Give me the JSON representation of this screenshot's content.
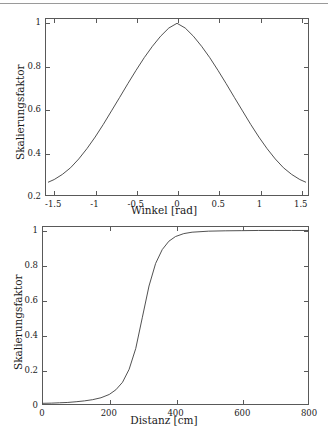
{
  "page": {
    "background": "#ffffff",
    "axis_color": "#595959",
    "curve_color": "#3d3d3d",
    "text_color": "#1a1a1a"
  },
  "chart_data": [
    {
      "type": "line",
      "title": "",
      "subtitle": "",
      "xlabel": "Winkel [rad]",
      "ylabel": "Skalierungsfaktor",
      "xlim": [
        -1.6,
        1.6
      ],
      "ylim": [
        0.2,
        1.02
      ],
      "grid": false,
      "legend": null,
      "xticks": [
        -1.5,
        -1,
        -0.5,
        0,
        0.5,
        1,
        1.5
      ],
      "xticklabels": [
        "-1.5",
        "-1",
        "-0.5",
        "0",
        "0.5",
        "1",
        "1.5"
      ],
      "yticks": [
        0.2,
        0.4,
        0.6,
        0.8,
        1
      ],
      "yticklabels": [
        "0.2",
        "0.4",
        "0.6",
        "0.8",
        "1"
      ],
      "series": [
        {
          "name": "Skalierungsfaktor(Winkel)",
          "x": [
            -1.571,
            -1.5,
            -1.4,
            -1.3,
            -1.2,
            -1.1,
            -1.0,
            -0.9,
            -0.8,
            -0.7,
            -0.6,
            -0.5,
            -0.4,
            -0.3,
            -0.2,
            -0.1,
            0.0,
            0.1,
            0.2,
            0.3,
            0.4,
            0.5,
            0.6,
            0.7,
            0.8,
            0.9,
            1.0,
            1.1,
            1.2,
            1.3,
            1.4,
            1.5,
            1.571
          ],
          "y": [
            0.26,
            0.272,
            0.296,
            0.327,
            0.368,
            0.416,
            0.47,
            0.529,
            0.592,
            0.655,
            0.719,
            0.781,
            0.84,
            0.893,
            0.94,
            0.978,
            1.0,
            0.978,
            0.94,
            0.893,
            0.84,
            0.781,
            0.719,
            0.655,
            0.592,
            0.529,
            0.47,
            0.416,
            0.368,
            0.327,
            0.296,
            0.272,
            0.26
          ]
        }
      ]
    },
    {
      "type": "line",
      "title": "",
      "subtitle": "",
      "xlabel": "Distanz [cm]",
      "ylabel": "Skalierungsfaktor",
      "xlim": [
        0,
        800
      ],
      "ylim": [
        0,
        1.02
      ],
      "grid": false,
      "legend": null,
      "xticks": [
        0,
        200,
        400,
        600,
        800
      ],
      "xticklabels": [
        "0",
        "200",
        "400",
        "600",
        "800"
      ],
      "yticks": [
        0,
        0.2,
        0.4,
        0.6,
        0.8,
        1
      ],
      "yticklabels": [
        "0",
        "0.2",
        "0.4",
        "0.6",
        "0.8",
        "1"
      ],
      "series": [
        {
          "name": "Skalierungsfaktor(Distanz)",
          "x": [
            0,
            25,
            50,
            75,
            100,
            125,
            150,
            175,
            200,
            220,
            240,
            260,
            280,
            300,
            320,
            340,
            360,
            380,
            400,
            425,
            450,
            500,
            550,
            600,
            650,
            700,
            750,
            800
          ],
          "y": [
            0.004,
            0.005,
            0.007,
            0.009,
            0.013,
            0.018,
            0.025,
            0.036,
            0.055,
            0.082,
            0.125,
            0.2,
            0.32,
            0.5,
            0.68,
            0.81,
            0.89,
            0.938,
            0.965,
            0.982,
            0.99,
            0.996,
            0.998,
            0.999,
            1.0,
            1.0,
            1.0,
            1.0
          ]
        }
      ]
    }
  ]
}
